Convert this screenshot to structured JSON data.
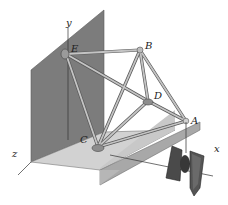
{
  "figure": {
    "type": "space truss diagram",
    "joints": [
      {
        "id": "A",
        "label": "A"
      },
      {
        "id": "B",
        "label": "B"
      },
      {
        "id": "C",
        "label": "C"
      },
      {
        "id": "D",
        "label": "D"
      },
      {
        "id": "E",
        "label": "E"
      }
    ],
    "axes": {
      "x": "x",
      "y": "y",
      "z": "z"
    },
    "load": "hanging weight at A",
    "colors": {
      "wall": "#7a7a7a",
      "floor": "#cfcfcf",
      "floor_side": "#a9a9a9",
      "member": "#b9b9b9",
      "member_edge": "#555555",
      "weight": "#4a4a4a"
    }
  }
}
